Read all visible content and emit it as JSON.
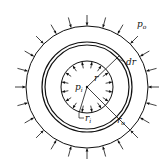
{
  "diagram": {
    "labels": {
      "outer_pressure": "p",
      "outer_pressure_sub": "o",
      "inner_pressure": "p",
      "inner_pressure_sub": "i",
      "radius": "r",
      "radius_increment": "dr",
      "inner_radius": "r",
      "inner_radius_sub": "i",
      "outer_radius": "r",
      "outer_radius_sub": "o"
    },
    "geometry": {
      "center": [
        87,
        87
      ],
      "outer_radius_px": 61,
      "element_ring_radii_px": [
        42,
        45
      ],
      "inner_radius_px": 26,
      "outer_arrow_count": 24,
      "inner_arrow_count": 16
    },
    "colors": {
      "stroke": "#111111",
      "background": "#ffffff"
    }
  }
}
